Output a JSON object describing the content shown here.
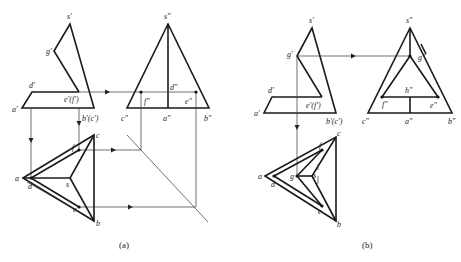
{
  "figure_a": {
    "caption": "(a)",
    "labels": {
      "s1": "s′",
      "g1": "g′",
      "d1": "d′",
      "a1": "a′",
      "ef1": "e′(f′)",
      "bc1": "b′(c′)",
      "s2": "s″",
      "d2": "d″",
      "f2": "f″",
      "e2": "e″",
      "c2": "c″",
      "a2": "a″",
      "b2": "b″",
      "a": "a",
      "d": "d",
      "s": "s",
      "c": "c",
      "f": "f",
      "e": "e",
      "b": "b"
    }
  },
  "figure_b": {
    "caption": "(b)",
    "labels": {
      "s1": "s′",
      "g1": "g′",
      "d1": "d′",
      "a1": "a′",
      "ef1": "e′(f′)",
      "bc1": "b′(c′)",
      "s2": "s″",
      "g2": "g″",
      "h2": "h″",
      "f2": "f″",
      "e2": "e″",
      "c2": "c″",
      "a2": "a″",
      "b2": "b″",
      "a": "a",
      "d": "d",
      "g": "g",
      "s": "s",
      "c": "c",
      "f": "f",
      "e": "e",
      "b": "b"
    }
  },
  "colors": {
    "line": "#1a1a1a",
    "background": "#ffffff"
  }
}
